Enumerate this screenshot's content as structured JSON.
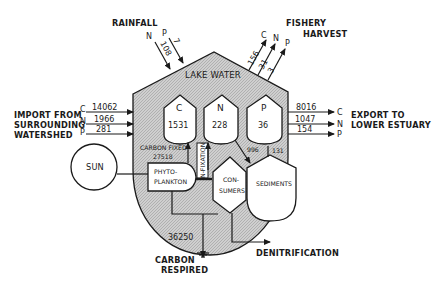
{
  "diagram": {
    "container": {
      "label": "LAKE WATER",
      "fill_color": "#c8c8c8"
    },
    "pools": [
      {
        "id": "C",
        "label": "C",
        "value": "1531"
      },
      {
        "id": "N",
        "label": "N",
        "value": "228"
      },
      {
        "id": "P",
        "label": "P",
        "value": "36"
      }
    ],
    "compartments": {
      "sun": "SUN",
      "phytoplankton_line1": "PHYTO-",
      "phytoplankton_line2": "PLANKTON",
      "consumers_line1": "CON-",
      "consumers_line2": "SUMERS",
      "sediments": "SEDIMENTS"
    },
    "rainfall": {
      "label": "RAINFALL",
      "flows": [
        {
          "element": "N",
          "value": "108"
        },
        {
          "element": "P",
          "value": "7"
        }
      ]
    },
    "fishery": {
      "label_line1": "FISHERY",
      "label_line2": "HARVEST",
      "flows": [
        {
          "element": "C",
          "value": "156"
        },
        {
          "element": "N",
          "value": "31"
        },
        {
          "element": "P",
          "value": "3"
        }
      ]
    },
    "import": {
      "label_line1": "IMPORT FROM",
      "label_line2": "SURROUNDING",
      "label_line3": "WATERSHED",
      "flows": [
        {
          "element": "C",
          "value": "14062"
        },
        {
          "element": "N",
          "value": "1966"
        },
        {
          "element": "P",
          "value": "281"
        }
      ]
    },
    "export": {
      "label_line1": "EXPORT TO",
      "label_line2": "LOWER ESTUARY",
      "flows": [
        {
          "element": "C",
          "value": "8016"
        },
        {
          "element": "N",
          "value": "1047"
        },
        {
          "element": "P",
          "value": "154"
        }
      ]
    },
    "internal": {
      "carbon_fixed_label": "CARBON FIXED",
      "carbon_fixed_value": "27518",
      "n_fixation_label": "N-FIXATION",
      "flow_996": "996",
      "flow_131": "131"
    },
    "respiration": {
      "value": "36250",
      "label_line1": "CARBON",
      "label_line2": "RESPIRED"
    },
    "denitrification": {
      "label": "DENITRIFICATION"
    }
  }
}
